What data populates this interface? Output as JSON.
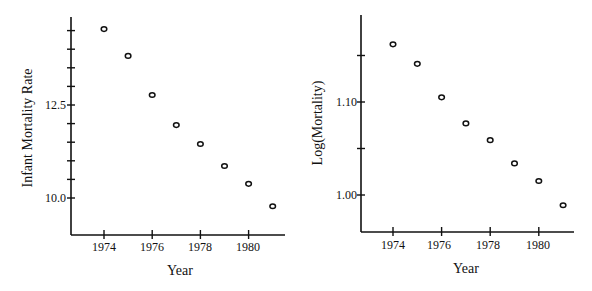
{
  "chart_data": [
    {
      "type": "scatter",
      "title": "",
      "xlabel": "Year",
      "ylabel": "Infant Mortality Rate",
      "x": [
        1974,
        1975,
        1976,
        1977,
        1978,
        1979,
        1980,
        1981
      ],
      "values": [
        14.54,
        13.82,
        12.77,
        11.96,
        11.45,
        10.86,
        10.38,
        9.78
      ],
      "xticks": [
        "1974",
        "1976",
        "1978",
        "1980"
      ],
      "yticks_labeled": [
        "10.0",
        "12.5"
      ],
      "ytick_step": 0.5,
      "xlim": [
        1972.7,
        1981.5
      ],
      "ylim": [
        9.0,
        15.0
      ],
      "grid": false,
      "marker": "open-circle"
    },
    {
      "type": "scatter",
      "title": "",
      "xlabel": "Year",
      "ylabel": "Log(Mortality)",
      "x": [
        1974,
        1975,
        1976,
        1977,
        1978,
        1979,
        1980,
        1981
      ],
      "values": [
        1.162,
        1.141,
        1.105,
        1.077,
        1.059,
        1.034,
        1.015,
        0.989
      ],
      "xticks": [
        "1974",
        "1976",
        "1978",
        "1980"
      ],
      "yticks_labeled": [
        "1.00",
        "1.10"
      ],
      "ytick_step": 0.05,
      "xlim": [
        1972.7,
        1981.5
      ],
      "ylim": [
        0.96,
        1.19
      ],
      "grid": false,
      "marker": "open-circle"
    }
  ],
  "left": {
    "ylabel": "Infant Mortality Rate",
    "xlabel": "Year",
    "yticks": [
      {
        "label": "12.5",
        "value": 12.5
      },
      {
        "label": "10.0",
        "value": 10.0
      }
    ],
    "xticks": [
      {
        "label": "1974",
        "value": 1974
      },
      {
        "label": "1976",
        "value": 1976
      },
      {
        "label": "1978",
        "value": 1978
      },
      {
        "label": "1980",
        "value": 1980
      }
    ]
  },
  "right": {
    "ylabel": "Log(Mortality)",
    "xlabel": "Year",
    "yticks": [
      {
        "label": "1.10",
        "value": 1.1
      },
      {
        "label": "1.00",
        "value": 1.0
      }
    ],
    "xticks": [
      {
        "label": "1974",
        "value": 1974
      },
      {
        "label": "1976",
        "value": 1976
      },
      {
        "label": "1978",
        "value": 1978
      },
      {
        "label": "1980",
        "value": 1980
      }
    ]
  }
}
